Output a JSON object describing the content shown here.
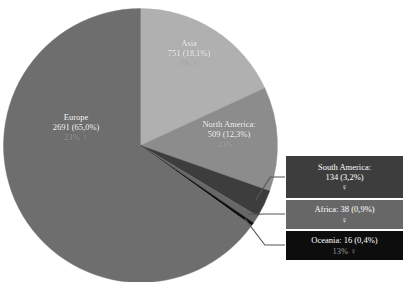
{
  "chart_data": {
    "type": "pie",
    "title": "",
    "subtitle": "",
    "xlabel": "",
    "ylabel": "",
    "legend_position": "none",
    "grid": false,
    "total": 4139,
    "categories": [
      "Asia",
      "North America",
      "South America",
      "Africa",
      "Oceania",
      "Europe"
    ],
    "values": [
      751,
      509,
      134,
      38,
      16,
      2691
    ],
    "percents": [
      18.1,
      12.3,
      3.2,
      0.9,
      0.4,
      65.0
    ],
    "slices": [
      {
        "name": "Asia",
        "value": 751,
        "percent": 18.1,
        "percent_label": "18,1%",
        "color": "#b0b0b0",
        "start_angle": 0,
        "end_angle": 65.16,
        "label_line1": "Asia",
        "label_line2": "751 (18,1%)",
        "label_line3": "7% ♀",
        "callout": false
      },
      {
        "name": "North America",
        "value": 509,
        "percent": 12.3,
        "percent_label": "12,3%",
        "color": "#8c8c8c",
        "start_angle": 65.16,
        "end_angle": 109.43,
        "label_line1": "North America:",
        "label_line2": "509 (12,3%)",
        "label_line3": "20% ♀",
        "callout": false
      },
      {
        "name": "South America",
        "value": 134,
        "percent": 3.2,
        "percent_label": "3,2%",
        "color": "#3d3d3d",
        "start_angle": 109.43,
        "end_angle": 121.09,
        "label_line1": "South America:",
        "label_line2": "134 (3,2%)",
        "label_line3": "♀",
        "callout": true
      },
      {
        "name": "Africa",
        "value": 38,
        "percent": 0.9,
        "percent_label": "0,9%",
        "color": "#676767",
        "start_angle": 121.09,
        "end_angle": 124.39,
        "label_line1": "Africa: 38 (0,9%)",
        "label_line2": "♀",
        "label_line3": "",
        "callout": true
      },
      {
        "name": "Oceania",
        "value": 16,
        "percent": 0.4,
        "percent_label": "0,4%",
        "color": "#0d0d0d",
        "start_angle": 124.39,
        "end_angle": 125.78,
        "label_line1": "Oceania: 16 (0,4%)",
        "label_line2": "13% ♀",
        "label_line3": "",
        "callout": true
      },
      {
        "name": "Europe",
        "value": 2691,
        "percent": 65.0,
        "percent_label": "65,0%",
        "color": "#6e6e6e",
        "start_angle": 125.78,
        "end_angle": 360,
        "label_line1": "Europe",
        "label_line2": "2691 (65,0%)",
        "label_line3": "23% ♀",
        "callout": false
      }
    ],
    "callout_boxes": [
      {
        "name": "South America",
        "main": "South America:",
        "value_line": "134 (3,2%)",
        "sub": "♀",
        "color": "#3d3d3d",
        "dim_sub": false
      },
      {
        "name": "Africa",
        "main": "Africa: 38 (0,9%)",
        "value_line": "",
        "sub": "♀",
        "color": "#676767",
        "dim_sub": false
      },
      {
        "name": "Oceania",
        "main": "Oceania: 16 (0,4%)",
        "value_line": "",
        "sub": "13% ♀",
        "color": "#0d0d0d",
        "dim_sub": true
      }
    ],
    "colors": {
      "europe": "#6e6e6e",
      "asia": "#b0b0b0",
      "north_america": "#8c8c8c",
      "south_america": "#3d3d3d",
      "africa": "#676767",
      "oceania": "#0d0d0d",
      "background": "#ffffff",
      "leader_line": "#555555",
      "label_text": "#ffffff"
    }
  }
}
